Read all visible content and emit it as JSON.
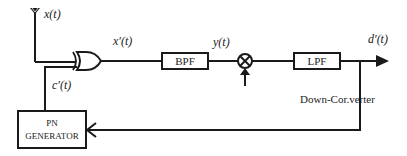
{
  "diagram": {
    "type": "block-diagram",
    "signals": {
      "input": "x(t)",
      "despread": "x′(t)",
      "filtered": "y(t)",
      "output": "d′(t)",
      "pn_code": "c′(t)"
    },
    "blocks": {
      "xor": "XOR",
      "bpf": "BPF",
      "mixer": "⊗",
      "lpf": "LPF",
      "pn_line1": "PN",
      "pn_line2": "GENERATOR"
    },
    "annotations": {
      "down_converter": "Down-Cor.verter"
    },
    "colors": {
      "stroke": "#1a1a1a",
      "background": "#ffffff"
    }
  }
}
